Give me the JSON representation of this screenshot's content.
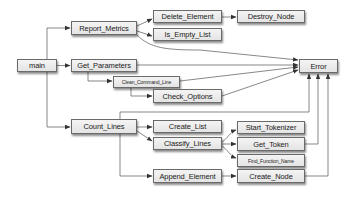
{
  "diagram": {
    "type": "call-graph",
    "nodes": [
      {
        "id": "main",
        "label": "main"
      },
      {
        "id": "report_metrics",
        "label": "Report_Metrics"
      },
      {
        "id": "get_parameters",
        "label": "Get_Parameters"
      },
      {
        "id": "clean_command_line",
        "label": "Clean_Command_Line"
      },
      {
        "id": "check_options",
        "label": "Check_Options"
      },
      {
        "id": "count_lines",
        "label": "Count_Lines"
      },
      {
        "id": "delete_element",
        "label": "Delete_Element"
      },
      {
        "id": "is_empty_list",
        "label": "Is_Empty_List"
      },
      {
        "id": "destroy_node",
        "label": "Destroy_Node"
      },
      {
        "id": "error",
        "label": "Error"
      },
      {
        "id": "create_list",
        "label": "Create_List"
      },
      {
        "id": "classify_lines",
        "label": "Classify_Lines"
      },
      {
        "id": "append_element",
        "label": "Append_Element"
      },
      {
        "id": "start_tokenizer",
        "label": "Start_Tokenizer"
      },
      {
        "id": "get_token",
        "label": "Get_Token"
      },
      {
        "id": "find_function_name",
        "label": "Find_Function_Name"
      },
      {
        "id": "create_node",
        "label": "Create_Node"
      }
    ],
    "edges": [
      {
        "from": "main",
        "to": "report_metrics"
      },
      {
        "from": "main",
        "to": "get_parameters"
      },
      {
        "from": "main",
        "to": "count_lines"
      },
      {
        "from": "report_metrics",
        "to": "delete_element"
      },
      {
        "from": "report_metrics",
        "to": "is_empty_list"
      },
      {
        "from": "report_metrics",
        "to": "error"
      },
      {
        "from": "delete_element",
        "to": "destroy_node"
      },
      {
        "from": "get_parameters",
        "to": "clean_command_line"
      },
      {
        "from": "get_parameters",
        "to": "error"
      },
      {
        "from": "clean_command_line",
        "to": "check_options"
      },
      {
        "from": "clean_command_line",
        "to": "error"
      },
      {
        "from": "check_options",
        "to": "error"
      },
      {
        "from": "count_lines",
        "to": "create_list"
      },
      {
        "from": "count_lines",
        "to": "classify_lines"
      },
      {
        "from": "count_lines",
        "to": "append_element"
      },
      {
        "from": "count_lines",
        "to": "error"
      },
      {
        "from": "classify_lines",
        "to": "start_tokenizer"
      },
      {
        "from": "classify_lines",
        "to": "get_token"
      },
      {
        "from": "classify_lines",
        "to": "find_function_name"
      },
      {
        "from": "get_token",
        "to": "error"
      },
      {
        "from": "append_element",
        "to": "create_node"
      },
      {
        "from": "create_node",
        "to": "error"
      }
    ]
  }
}
